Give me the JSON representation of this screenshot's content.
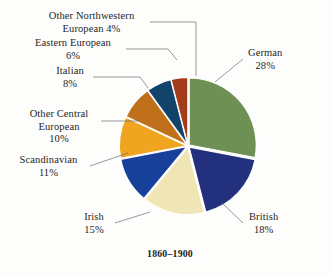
{
  "figure": {
    "caption": "1860–1900",
    "background": "#fdfdfc"
  },
  "chart_data": {
    "type": "pie",
    "title": "1860–1900",
    "subtitle": "",
    "xlabel": "",
    "ylabel": "",
    "legend_position": "callout-labels",
    "grid": false,
    "unit": "%",
    "start_angle_deg": 0,
    "direction": "clockwise",
    "categories": [
      "German",
      "British",
      "Irish",
      "Scandinavian",
      "Other Central European",
      "Italian",
      "Eastern European",
      "Other Northwestern European"
    ],
    "values": [
      28,
      18,
      15,
      11,
      10,
      8,
      6,
      4
    ],
    "colors": [
      "#6f9055",
      "#23307d",
      "#f0e5b5",
      "#17409b",
      "#efa520",
      "#c0701a",
      "#11436b",
      "#a33c1a"
    ],
    "slices": [
      {
        "label": "German",
        "value": 28,
        "value_text": "28%",
        "color": "#6f9055"
      },
      {
        "label": "British",
        "value": 18,
        "value_text": "18%",
        "color": "#23307d"
      },
      {
        "label": "Irish",
        "value": 15,
        "value_text": "15%",
        "color": "#f0e5b5"
      },
      {
        "label": "Scandinavian",
        "value": 11,
        "value_text": "11%",
        "color": "#17409b"
      },
      {
        "label": "Other Central European",
        "value": 10,
        "value_text": "10%",
        "color": "#efa520"
      },
      {
        "label": "Italian",
        "value": 8,
        "value_text": "8%",
        "color": "#c0701a"
      },
      {
        "label": "Eastern European",
        "value": 6,
        "value_text": "6%",
        "color": "#11436b"
      },
      {
        "label": "Other Northwestern European",
        "value": 4,
        "value_text": "4%",
        "color": "#a33c1a"
      }
    ]
  },
  "labels": {
    "german": {
      "line1": "German",
      "line2": "28%"
    },
    "british": {
      "line1": "British",
      "line2": "18%"
    },
    "irish": {
      "line1": "Irish",
      "line2": "15%"
    },
    "scandinavian": {
      "line1": "Scandinavian",
      "line2": "11%"
    },
    "other_central_european": {
      "line1": "Other Central",
      "line2": "European",
      "line3": "10%"
    },
    "italian": {
      "line1": "Italian",
      "line2": "8%"
    },
    "eastern_european": {
      "line1": "Eastern European",
      "line2": "6%"
    },
    "other_northwestern_european": {
      "line1": "Other Northwestern",
      "line2": "European 4%"
    }
  }
}
